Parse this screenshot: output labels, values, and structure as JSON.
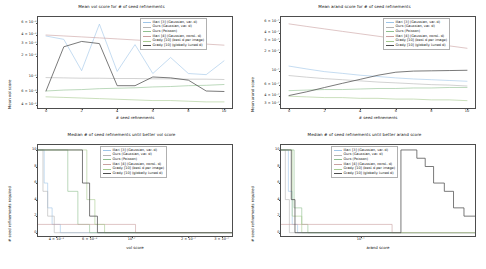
{
  "figure": {
    "background": "#ffffff",
    "width": 486,
    "height": 269
  },
  "series_names": [
    "Illari [3] (Gaussian, var. d)",
    "Ours (Gaussian, var. d)",
    "Ours (Poisson)",
    "Illari [4] (Gaussian, const. d)",
    "Grady [10] (best d per image)",
    "Grady [10] (globally tuned d)"
  ],
  "series_colors": [
    "#9ec5e8",
    "#b4b4b4",
    "#8fbf8f",
    "#c9a0a0",
    "#a6c98f",
    "#4d4d4d"
  ],
  "chart_data": [
    {
      "id": "mean-vol-score",
      "type": "line",
      "title": "Mean vol score for # of seed refinements",
      "xlabel": "# seed refinements",
      "ylabel": "Mean vol score",
      "xscale": "linear",
      "yscale": "log",
      "xlim": [
        -0.45,
        10.45
      ],
      "ylim": [
        0.00036,
        0.0072
      ],
      "grid": false,
      "xticks": [
        0,
        2,
        4,
        6,
        8,
        10
      ],
      "xticklabels": [
        "0",
        "2",
        "4",
        "6",
        "8",
        "10"
      ],
      "yticks": [
        0.006,
        0.004,
        0.003,
        0.002,
        0.001,
        0.0006,
        0.0004
      ],
      "yticklabels": [
        "6 × 10⁻³",
        "4 × 10⁻³",
        "3 × 10⁻³",
        "2 × 10⁻³",
        "10⁻³",
        "6 × 10⁻⁴",
        "4 × 10⁻⁴"
      ],
      "x": [
        0,
        1,
        2,
        3,
        4,
        5,
        6,
        7,
        8,
        9,
        10
      ],
      "series": [
        {
          "name": "Illari [3] (Gaussian, var. d)",
          "color": "#9ec5e8",
          "values": [
            0.00385,
            0.00345,
            0.00123,
            0.0057,
            0.0012,
            0.0029,
            0.00112,
            0.0019,
            0.00112,
            0.00108,
            0.0017
          ]
        },
        {
          "name": "Ours (Gaussian, var. d)",
          "color": "#b4b4b4",
          "values": [
            0.00098,
            0.00097,
            0.00096,
            0.00096,
            0.00095,
            0.00095,
            0.00094,
            0.00094,
            0.00093,
            0.00093,
            0.00092
          ]
        },
        {
          "name": "Ours (Poisson)",
          "color": "#8fbf8f",
          "values": [
            0.00063,
            0.00065,
            0.00066,
            0.00068,
            0.00069,
            0.0007,
            0.00072,
            0.00073,
            0.00075,
            0.00076,
            0.00078
          ]
        },
        {
          "name": "Illari [4] (Gaussian, const. d)",
          "color": "#c9a0a0",
          "values": [
            0.00398,
            0.00386,
            0.00374,
            0.00362,
            0.0035,
            0.00338,
            0.00327,
            0.00316,
            0.00305,
            0.00295,
            0.00285
          ]
        },
        {
          "name": "Grady [10] (best d per image)",
          "color": "#a6c98f",
          "values": [
            0.00052,
            0.00051,
            0.0005,
            0.00049,
            0.00048,
            0.00047,
            0.00046,
            0.00046,
            0.00045,
            0.00044,
            0.00044
          ]
        },
        {
          "name": "Grady [10] (globally tuned d)",
          "color": "#4d4d4d",
          "values": [
            0.00063,
            0.0027,
            0.00322,
            0.003,
            0.00075,
            0.00075,
            0.001,
            0.00097,
            0.0009,
            0.00063,
            0.00062
          ]
        }
      ]
    },
    {
      "id": "mean-arand-score",
      "type": "line",
      "title": "Mean arand score for # of seed refinements",
      "xlabel": "# seed refinements",
      "ylabel": "Mean arand score",
      "xscale": "linear",
      "yscale": "log",
      "xlim": [
        -0.45,
        10.45
      ],
      "ylim": [
        0.026,
        0.72
      ],
      "grid": false,
      "xticks": [
        0,
        2,
        4,
        6,
        8,
        10
      ],
      "xticklabels": [
        "0",
        "2",
        "4",
        "6",
        "8",
        "10"
      ],
      "yticks": [
        0.6,
        0.4,
        0.3,
        0.2,
        0.1,
        0.06,
        0.04,
        0.03
      ],
      "yticklabels": [
        "6 × 10⁻¹",
        "4 × 10⁻¹",
        "3 × 10⁻¹",
        "2 × 10⁻¹",
        "10⁻¹",
        "6 × 10⁻²",
        "4 × 10⁻²",
        "3 × 10⁻²"
      ],
      "x": [
        0,
        1,
        2,
        3,
        4,
        5,
        6,
        7,
        8,
        9,
        10
      ],
      "series": [
        {
          "name": "Illari [3] (Gaussian, var. d)",
          "color": "#9ec5e8",
          "values": [
            0.12,
            0.108,
            0.098,
            0.092,
            0.086,
            0.082,
            0.078,
            0.075,
            0.073,
            0.071,
            0.069
          ]
        },
        {
          "name": "Ours (Gaussian, var. d)",
          "color": "#b4b4b4",
          "values": [
            0.085,
            0.08,
            0.076,
            0.073,
            0.07,
            0.067,
            0.065,
            0.063,
            0.061,
            0.06,
            0.058
          ]
        },
        {
          "name": "Ours (Poisson)",
          "color": "#8fbf8f",
          "values": [
            0.049,
            0.05,
            0.051,
            0.051,
            0.052,
            0.053,
            0.053,
            0.054,
            0.054,
            0.055,
            0.055
          ]
        },
        {
          "name": "Illari [4] (Gaussian, const. d)",
          "color": "#c9a0a0",
          "values": [
            0.56,
            0.51,
            0.466,
            0.426,
            0.39,
            0.357,
            0.327,
            0.299,
            0.274,
            0.251,
            0.23
          ]
        },
        {
          "name": "Grady [10] (best d per image)",
          "color": "#a6c98f",
          "values": [
            0.04,
            0.039,
            0.038,
            0.038,
            0.037,
            0.037,
            0.036,
            0.036,
            0.035,
            0.035,
            0.034
          ]
        },
        {
          "name": "Grady [10] (globally tuned d)",
          "color": "#4d4d4d",
          "values": [
            0.041,
            0.047,
            0.055,
            0.064,
            0.074,
            0.086,
            0.096,
            0.1,
            0.101,
            0.102,
            0.103
          ]
        }
      ]
    },
    {
      "id": "median-refinements-vol",
      "type": "line",
      "title": "Median # of seed refinements until better vol score",
      "xlabel": "vol score",
      "ylabel": "# seed refinements required",
      "xscale": "log",
      "yscale": "linear",
      "xlim": [
        0.0032,
        0.034
      ],
      "ylim": [
        -0.4,
        10.6
      ],
      "grid": false,
      "xticks": [
        0.004,
        0.006,
        0.01,
        0.02,
        0.03
      ],
      "xticklabels": [
        "4 × 10⁻³",
        "6 × 10⁻³",
        "10⁻²",
        "2 × 10⁻²",
        "3 × 10⁻²"
      ],
      "yticks": [
        0,
        2,
        4,
        6,
        8,
        10
      ],
      "yticklabels": [
        "0",
        "2",
        "4",
        "6",
        "8",
        "10"
      ],
      "series": [
        {
          "name": "Illari [3] (Gaussian, var. d)",
          "color": "#9ec5e8",
          "steps": [
            [
              0.0032,
              10
            ],
            [
              0.00345,
              10
            ],
            [
              0.00345,
              6
            ],
            [
              0.0036,
              6
            ],
            [
              0.0036,
              3
            ],
            [
              0.0038,
              3
            ],
            [
              0.0038,
              1
            ],
            [
              0.0042,
              1
            ],
            [
              0.0042,
              0
            ],
            [
              0.034,
              0
            ]
          ]
        },
        {
          "name": "Ours (Gaussian, var. d)",
          "color": "#b4b4b4",
          "steps": [
            [
              0.0032,
              10
            ],
            [
              0.0034,
              10
            ],
            [
              0.0034,
              5
            ],
            [
              0.0036,
              5
            ],
            [
              0.0036,
              2
            ],
            [
              0.0039,
              2
            ],
            [
              0.0039,
              0
            ],
            [
              0.034,
              0
            ]
          ]
        },
        {
          "name": "Ours (Poisson)",
          "color": "#8fbf8f",
          "steps": [
            [
              0.0032,
              10
            ],
            [
              0.0046,
              10
            ],
            [
              0.0046,
              5
            ],
            [
              0.0052,
              5
            ],
            [
              0.0052,
              1
            ],
            [
              0.006,
              1
            ],
            [
              0.006,
              0
            ],
            [
              0.034,
              0
            ]
          ]
        },
        {
          "name": "Illari [4] (Gaussian, const. d)",
          "color": "#c9a0a0",
          "steps": [
            [
              0.0032,
              1
            ],
            [
              0.0105,
              1
            ],
            [
              0.0105,
              0
            ],
            [
              0.034,
              0
            ]
          ]
        },
        {
          "name": "Grady [10] (best d per image)",
          "color": "#a6c98f",
          "steps": [
            [
              0.0032,
              10
            ],
            [
              0.0058,
              10
            ],
            [
              0.0058,
              4
            ],
            [
              0.0064,
              4
            ],
            [
              0.0064,
              1
            ],
            [
              0.0072,
              1
            ],
            [
              0.0072,
              0
            ],
            [
              0.034,
              0
            ]
          ]
        },
        {
          "name": "Grady [10] (globally tuned d)",
          "color": "#4d4d4d",
          "steps": [
            [
              0.0032,
              10
            ],
            [
              0.0055,
              10
            ],
            [
              0.0055,
              6
            ],
            [
              0.006,
              6
            ],
            [
              0.006,
              2
            ],
            [
              0.0066,
              2
            ],
            [
              0.0066,
              0
            ],
            [
              0.034,
              0
            ]
          ]
        }
      ]
    },
    {
      "id": "median-refinements-arand",
      "type": "line",
      "title": "Median # of seed refinements until better arand score",
      "xlabel": "arand score",
      "ylabel": "# seed refinements required",
      "xscale": "log",
      "yscale": "linear",
      "xlim": [
        0.028,
        0.62
      ],
      "ylim": [
        -0.4,
        10.6
      ],
      "grid": false,
      "xticks": [
        0.1
      ],
      "xticklabels": [
        "10⁻¹"
      ],
      "yticks": [
        0,
        2,
        4,
        6,
        8,
        10
      ],
      "yticklabels": [
        "0",
        "2",
        "4",
        "6",
        "8",
        "10"
      ],
      "series": [
        {
          "name": "Illari [3] (Gaussian, var. d)",
          "color": "#9ec5e8",
          "steps": [
            [
              0.028,
              10
            ],
            [
              0.0315,
              10
            ],
            [
              0.0315,
              5
            ],
            [
              0.0335,
              5
            ],
            [
              0.0335,
              1
            ],
            [
              0.0365,
              1
            ],
            [
              0.0365,
              0
            ],
            [
              0.62,
              0
            ]
          ]
        },
        {
          "name": "Ours (Gaussian, var. d)",
          "color": "#b4b4b4",
          "steps": [
            [
              0.028,
              10
            ],
            [
              0.03,
              10
            ],
            [
              0.03,
              4
            ],
            [
              0.032,
              4
            ],
            [
              0.032,
              0
            ],
            [
              0.62,
              0
            ]
          ]
        },
        {
          "name": "Ours (Poisson)",
          "color": "#8fbf8f",
          "steps": [
            [
              0.028,
              10
            ],
            [
              0.0345,
              10
            ],
            [
              0.0345,
              3
            ],
            [
              0.039,
              3
            ],
            [
              0.039,
              1
            ],
            [
              0.043,
              1
            ],
            [
              0.043,
              0
            ],
            [
              0.62,
              0
            ]
          ]
        },
        {
          "name": "Illari [4] (Gaussian, const. d)",
          "color": "#c9a0a0",
          "steps": [
            [
              0.028,
              1
            ],
            [
              0.165,
              1
            ],
            [
              0.165,
              0
            ],
            [
              0.62,
              0
            ]
          ]
        },
        {
          "name": "Grady [10] (best d per image)",
          "color": "#a6c98f",
          "steps": [
            [
              0.028,
              10
            ],
            [
              0.0335,
              10
            ],
            [
              0.0335,
              2
            ],
            [
              0.039,
              2
            ],
            [
              0.039,
              0
            ],
            [
              0.62,
              0
            ]
          ]
        },
        {
          "name": "Grady [10] (globally tuned d)",
          "color": "#4d4d4d",
          "steps": [
            [
              0.028,
              10
            ],
            [
              0.033,
              10
            ],
            [
              0.033,
              4
            ],
            [
              0.035,
              4
            ],
            [
              0.035,
              0
            ],
            [
              0.19,
              0
            ],
            [
              0.19,
              10
            ],
            [
              0.245,
              10
            ],
            [
              0.245,
              9
            ],
            [
              0.28,
              9
            ],
            [
              0.28,
              8
            ],
            [
              0.32,
              8
            ],
            [
              0.32,
              6
            ],
            [
              0.38,
              6
            ],
            [
              0.38,
              5
            ],
            [
              0.44,
              5
            ],
            [
              0.44,
              3
            ],
            [
              0.52,
              3
            ],
            [
              0.52,
              2
            ],
            [
              0.62,
              2
            ]
          ]
        }
      ]
    }
  ]
}
